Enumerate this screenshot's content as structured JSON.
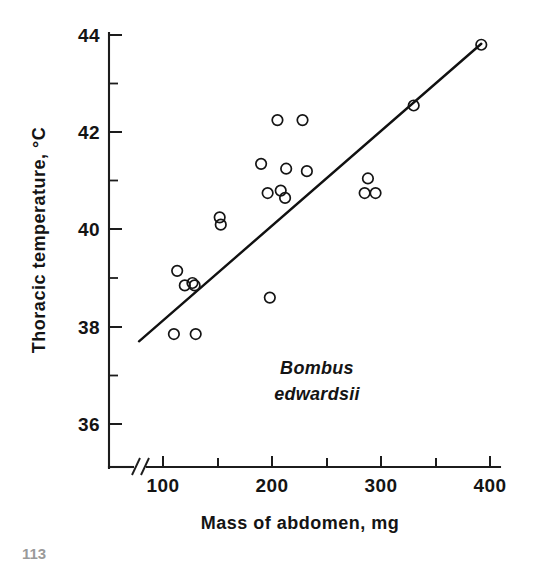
{
  "figure": {
    "background_color": "#ffffff",
    "ink_color": "#141414"
  },
  "chart_data": {
    "type": "scatter",
    "title": "",
    "subtitle": "",
    "xlabel": "Mass of abdomen, mg",
    "ylabel": "Thoracic temperature, °C",
    "xlim": [
      75,
      400
    ],
    "ylim": [
      35.0,
      44.0
    ],
    "grid": false,
    "legend": null,
    "legend_position": "none",
    "axis_break": {
      "present": true,
      "axis": "x",
      "symbol": "//",
      "note": "double slash break between origin and first tick"
    },
    "x_ticks_major": [
      100,
      150,
      200,
      250,
      300,
      350,
      400
    ],
    "x_tick_labels": [
      "100",
      "",
      "200",
      "",
      "300",
      "",
      "400"
    ],
    "y_ticks_major": [
      36,
      38,
      40,
      42,
      44
    ],
    "y_tick_labels": [
      "36",
      "38",
      "40",
      "42",
      "44"
    ],
    "y_ticks_minor": [
      37,
      39,
      41,
      43
    ],
    "annotations": [
      {
        "name": "species-name",
        "line1": "Bombus",
        "line2": "edwardsii",
        "style": "italic",
        "x": 230,
        "y": 37.05
      }
    ],
    "series": [
      {
        "name": "Bombus edwardsii individuals",
        "marker": "open-circle",
        "marker_size": 7,
        "x": [
          110,
          113,
          120,
          127,
          129,
          130,
          152,
          153,
          190,
          196,
          198,
          205,
          208,
          212,
          213,
          228,
          232,
          285,
          288,
          295,
          330,
          392
        ],
        "y": [
          37.85,
          39.15,
          38.85,
          38.9,
          38.85,
          37.85,
          40.25,
          40.1,
          41.35,
          40.75,
          38.6,
          42.25,
          40.8,
          40.65,
          41.25,
          42.25,
          41.2,
          40.75,
          41.05,
          40.75,
          42.55,
          43.8
        ],
        "values": [
          {
            "x": 110,
            "y": 37.85
          },
          {
            "x": 113,
            "y": 39.15
          },
          {
            "x": 120,
            "y": 38.85
          },
          {
            "x": 127,
            "y": 38.9
          },
          {
            "x": 129,
            "y": 38.85
          },
          {
            "x": 130,
            "y": 37.85
          },
          {
            "x": 152,
            "y": 40.25
          },
          {
            "x": 153,
            "y": 40.1
          },
          {
            "x": 190,
            "y": 41.35
          },
          {
            "x": 196,
            "y": 40.75
          },
          {
            "x": 198,
            "y": 38.6
          },
          {
            "x": 205,
            "y": 42.25
          },
          {
            "x": 208,
            "y": 40.8
          },
          {
            "x": 212,
            "y": 40.65
          },
          {
            "x": 213,
            "y": 41.25
          },
          {
            "x": 228,
            "y": 42.25
          },
          {
            "x": 232,
            "y": 41.2
          },
          {
            "x": 285,
            "y": 40.75
          },
          {
            "x": 288,
            "y": 41.05
          },
          {
            "x": 295,
            "y": 40.75
          },
          {
            "x": 330,
            "y": 42.55
          },
          {
            "x": 392,
            "y": 43.8
          }
        ]
      }
    ],
    "fit_line": {
      "name": "regression line",
      "x_start": 78,
      "y_start": 37.7,
      "x_end": 392,
      "y_end": 43.82
    }
  },
  "page_artifact": {
    "text": "113"
  }
}
